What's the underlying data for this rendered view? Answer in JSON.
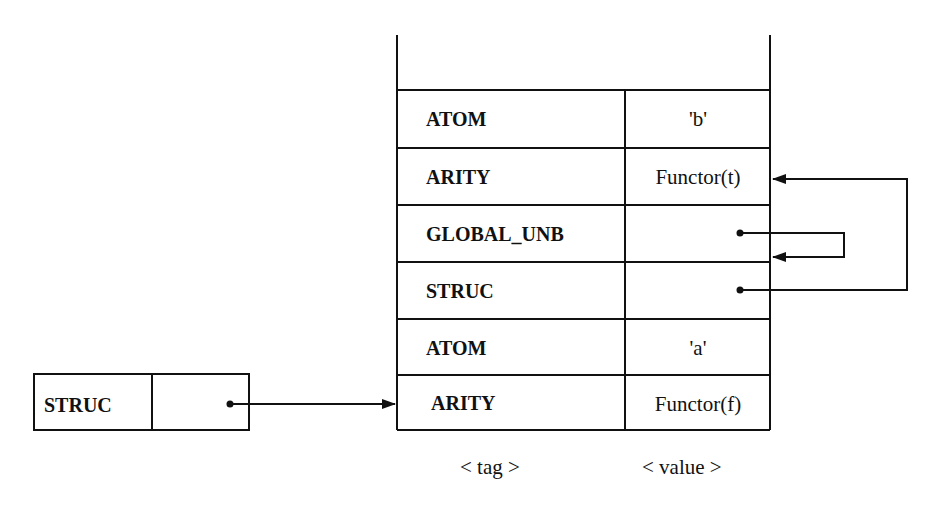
{
  "diagram": {
    "title": "",
    "heap_cells": [
      {
        "tag": "ATOM",
        "value": "'b'"
      },
      {
        "tag": "ARITY",
        "value": "Functor(t)"
      },
      {
        "tag": "GLOBAL_UNB",
        "value": ""
      },
      {
        "tag": "STRUC",
        "value": ""
      },
      {
        "tag": "ATOM",
        "value": "'a'"
      },
      {
        "tag": "ARITY",
        "value": "Functor(f)"
      }
    ],
    "column_labels": {
      "tag": "< tag >",
      "value": "< value >"
    },
    "register": {
      "tag": "STRUC",
      "value": ""
    },
    "arrows": [
      {
        "from": "register.value",
        "to": "heap_cells.5"
      },
      {
        "from": "heap_cells.2.value",
        "to": "heap_cells.2 (self-reference)"
      },
      {
        "from": "heap_cells.3.value",
        "to": "heap_cells.1"
      }
    ],
    "colors": {
      "line": "#111111",
      "background": "#ffffff"
    }
  }
}
